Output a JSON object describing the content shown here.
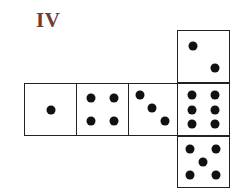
{
  "figure": {
    "label": "IV",
    "label_color": "#6e3b35",
    "faces": [
      {
        "name": "top",
        "pips": 2,
        "box": [
          177,
          30,
          53,
          53
        ],
        "pip_positions": [
          [
            0.3,
            0.3
          ],
          [
            0.72,
            0.72
          ]
        ]
      },
      {
        "name": "middle-1",
        "pips": 1,
        "box": [
          24,
          83,
          53,
          53
        ],
        "pip_positions": [
          [
            0.5,
            0.5
          ]
        ]
      },
      {
        "name": "middle-2",
        "pips": 4,
        "box": [
          76,
          83,
          53,
          53
        ],
        "pip_positions": [
          [
            0.27,
            0.27
          ],
          [
            0.73,
            0.27
          ],
          [
            0.27,
            0.73
          ],
          [
            0.73,
            0.73
          ]
        ]
      },
      {
        "name": "middle-3",
        "pips": 3,
        "box": [
          128,
          83,
          50,
          53
        ],
        "pip_positions": [
          [
            0.22,
            0.22
          ],
          [
            0.47,
            0.47
          ],
          [
            0.74,
            0.72
          ]
        ]
      },
      {
        "name": "middle-4",
        "pips": 6,
        "box": [
          177,
          83,
          53,
          53
        ],
        "pip_positions": [
          [
            0.27,
            0.22
          ],
          [
            0.73,
            0.22
          ],
          [
            0.27,
            0.5
          ],
          [
            0.73,
            0.5
          ],
          [
            0.27,
            0.78
          ],
          [
            0.73,
            0.78
          ]
        ]
      },
      {
        "name": "bottom",
        "pips": 5,
        "box": [
          177,
          136,
          53,
          52
        ],
        "pip_positions": [
          [
            0.24,
            0.24
          ],
          [
            0.74,
            0.24
          ],
          [
            0.49,
            0.49
          ],
          [
            0.24,
            0.76
          ],
          [
            0.74,
            0.76
          ]
        ]
      }
    ]
  }
}
